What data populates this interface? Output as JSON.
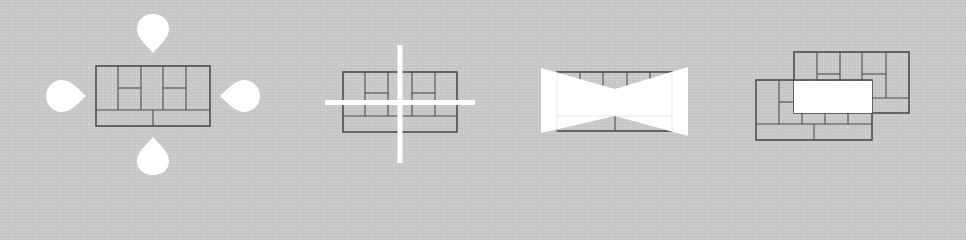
{
  "diagram": {
    "background_color": "#c9c9c9",
    "line_color": "#4d4d4d",
    "highlight_color": "#ffffff",
    "panels": [
      {
        "id": "pan",
        "description": "floor plan with four teardrop arrows pointing inward (up, down, left, right)",
        "icon": "pan-drops-icon"
      },
      {
        "id": "crosshair",
        "description": "floor plan overlaid by white crosshair lines",
        "icon": "crosshair-icon"
      },
      {
        "id": "bowtie",
        "description": "floor plan with white bow-tie perspective wedge",
        "icon": "perspective-icon"
      },
      {
        "id": "overlap",
        "description": "two overlapping floor plans with white highlighted intersection",
        "icon": "overlap-icon"
      }
    ]
  }
}
